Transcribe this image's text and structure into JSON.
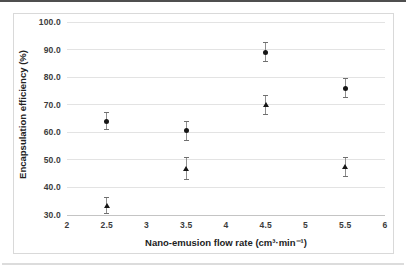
{
  "chart": {
    "y_axis_title": "Encapsulation efficiency (%)",
    "x_axis_title": "Nano-emusion flow rate (cm³·min⁻¹)"
  },
  "chart_data": {
    "type": "scatter",
    "title": "",
    "xlabel": "Nano-emusion flow rate (cm³·min⁻¹)",
    "ylabel": "Encapsulation efficiency (%)",
    "xlim": [
      2,
      6
    ],
    "ylim": [
      30,
      100
    ],
    "grid": "horizontal",
    "legend": "none",
    "x_ticks": {
      "values": [
        2,
        2.5,
        3,
        3.5,
        4,
        4.5,
        5,
        5.5,
        6
      ],
      "labels": [
        "2",
        "2.5",
        "3",
        "3.5",
        "4",
        "4.5",
        "5",
        "5.5",
        "6"
      ]
    },
    "y_ticks": {
      "values": [
        100,
        90,
        80,
        70,
        60,
        50,
        40,
        30
      ],
      "labels": [
        "100.0",
        "90.0",
        "80.0",
        "70.0",
        "60.0",
        "50.0",
        "40.0",
        "30.0"
      ]
    },
    "series": [
      {
        "name": "upper-points",
        "marker": "circle",
        "x": [
          2.5,
          3.5,
          4.5,
          5.5
        ],
        "y": [
          64.0,
          60.5,
          89.0,
          76.0
        ],
        "y_err": [
          3.0,
          3.5,
          3.5,
          3.5
        ]
      },
      {
        "name": "lower-points",
        "marker": "triangle",
        "x": [
          2.5,
          3.5,
          4.5,
          5.5
        ],
        "y": [
          33.5,
          47.0,
          70.0,
          47.5
        ],
        "y_err": [
          3.0,
          4.0,
          3.5,
          3.5
        ]
      }
    ],
    "colors": {
      "marker": "#161616",
      "error_bar": "#8f8f8f",
      "error_cap": "#6f6f6f",
      "gridline": "#e3e3e3",
      "axis_line": "#c4c4c4",
      "frame_border": "#d9d9d9",
      "tick_label": "#3c3c3c"
    }
  }
}
